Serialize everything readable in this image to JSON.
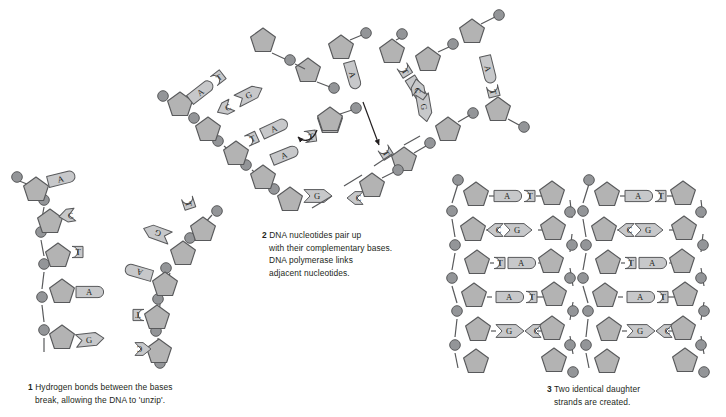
{
  "figure": {
    "background_color": "#ffffff",
    "palette": {
      "sugar_fill": "#b3b3b3",
      "sugar_stroke": "#58595b",
      "phosphate_fill": "#939598",
      "phosphate_stroke": "#58595b",
      "base_fill": "#c7c8ca",
      "base_stroke": "#58595b",
      "backbone_stroke": "#58595b",
      "arrow_color": "#231f20",
      "text_color": "#231f20"
    },
    "icon_names": {
      "sugar": "pentagon-sugar-icon",
      "phosphate": "circle-phosphate-icon",
      "base_a": "base-adenine-icon",
      "base_t": "base-thymine-icon",
      "base_c": "base-cytosine-icon",
      "base_g": "base-guanine-icon",
      "arrow": "arrow-icon"
    }
  },
  "panels": [
    {
      "number": "1",
      "caption_lines": [
        "Hydrogen bonds between the bases",
        "break, allowing the DNA to 'unzip'."
      ],
      "left_strand_bases": [
        "A",
        "C",
        "T",
        "A",
        "G"
      ],
      "right_strand_bases": [
        "T",
        "G",
        "A",
        "T",
        "C"
      ],
      "paired_rows": [
        "A-T",
        "C-G",
        "T-A",
        "A-T",
        "G-C"
      ],
      "note": "strands separated at top, still paired at bottom"
    },
    {
      "number": "2",
      "caption_lines": [
        "DNA nucleotides pair up",
        "with their complementary bases.",
        "DNA polymerase links",
        "adjacent nucleotides."
      ],
      "left_fork_pairs": [
        "A-T",
        "C-G",
        "T-A",
        "A-T",
        "G-"
      ],
      "right_fork_pairs": [
        "T-A",
        "-C",
        "G-",
        "A-T"
      ],
      "free_nucleotide_bases": [
        "A",
        "T",
        "A",
        "C",
        "G"
      ],
      "arrows": [
        "long-arrow-down",
        "short-curved-arrow"
      ]
    },
    {
      "number": "3",
      "caption_lines": [
        "Two identical daughter",
        "strands are created."
      ],
      "duplex_rows": [
        {
          "left": "A",
          "right": "T"
        },
        {
          "left": "C",
          "right": "G"
        },
        {
          "left": "T",
          "right": "A"
        },
        {
          "left": "A",
          "right": "T"
        },
        {
          "left": "G",
          "right": "C"
        }
      ],
      "duplex_count": 2
    }
  ]
}
